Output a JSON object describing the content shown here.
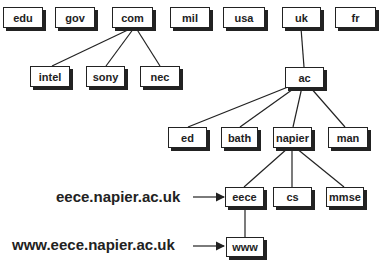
{
  "diagram": {
    "type": "dns-hierarchy-tree",
    "top_level_domains": [
      "edu",
      "gov",
      "com",
      "mil",
      "usa",
      "uk",
      "fr"
    ],
    "nodes": {
      "edu": "edu",
      "gov": "gov",
      "com": "com",
      "mil": "mil",
      "usa": "usa",
      "uk": "uk",
      "fr": "fr",
      "intel": "intel",
      "sony": "sony",
      "nec": "nec",
      "ac": "ac",
      "ed": "ed",
      "bath": "bath",
      "napier": "napier",
      "man": "man",
      "eece": "eece",
      "cs": "cs",
      "mmse": "mmse",
      "www": "www"
    },
    "edges": [
      [
        "com",
        "intel"
      ],
      [
        "com",
        "sony"
      ],
      [
        "com",
        "nec"
      ],
      [
        "uk",
        "ac"
      ],
      [
        "ac",
        "ed"
      ],
      [
        "ac",
        "bath"
      ],
      [
        "ac",
        "napier"
      ],
      [
        "ac",
        "man"
      ],
      [
        "napier",
        "eece"
      ],
      [
        "napier",
        "cs"
      ],
      [
        "napier",
        "mmse"
      ],
      [
        "eece",
        "www"
      ]
    ],
    "annotations": {
      "eece_fqdn": "eece.napier.ac.uk",
      "www_fqdn": "www.eece.napier.ac.uk"
    }
  }
}
